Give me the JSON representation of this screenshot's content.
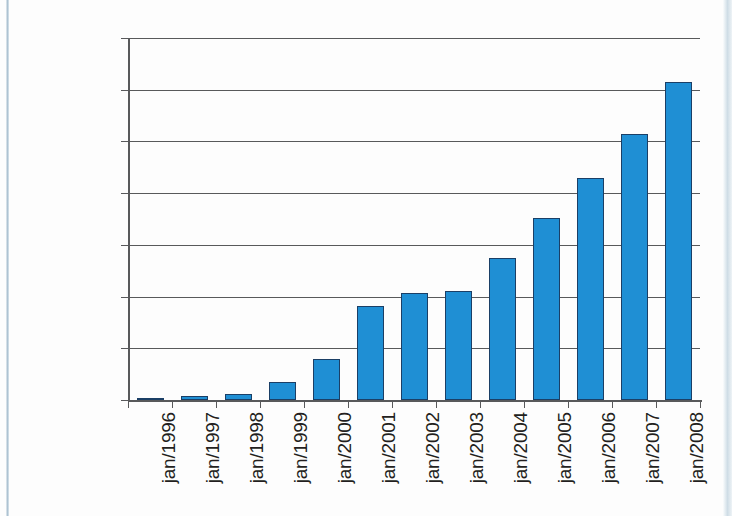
{
  "chart_data": {
    "type": "bar",
    "title": "",
    "subtitle": "",
    "xlabel": "",
    "ylabel": "",
    "categories": [
      "jan/1996",
      "jan/1997",
      "jan/1998",
      "jan/1999",
      "jan/2000",
      "jan/2001",
      "jan/2002",
      "jan/2003",
      "jan/2004",
      "jan/2005",
      "jan/2006",
      "jan/2007",
      "jan/2008"
    ],
    "values": [
      8000,
      15000,
      25000,
      68000,
      160000,
      365000,
      415000,
      420000,
      550000,
      705000,
      860000,
      1030000,
      1230000
    ],
    "ylim": [
      0,
      1400000
    ],
    "ytick_values": [
      0,
      200000,
      400000,
      600000,
      800000,
      1000000,
      1200000,
      1400000
    ],
    "ytick_labels": [
      "0",
      "200.000",
      "400.000",
      "600.000",
      "800.000",
      "1.000.000",
      "1.200.000",
      "1.400.000"
    ],
    "grid": true,
    "legend": null,
    "legend_position": "none",
    "series": [
      {
        "name": "",
        "values": [
          8000,
          15000,
          25000,
          68000,
          160000,
          365000,
          415000,
          420000,
          550000,
          705000,
          860000,
          1030000,
          1230000
        ]
      }
    ],
    "colors": {
      "bar_fill": "#1f8fd4",
      "bar_border": "#1b3f66",
      "axis": "#58595b",
      "grid": "#58595b",
      "text": "#231f20",
      "background": "#fdfdfd"
    }
  }
}
